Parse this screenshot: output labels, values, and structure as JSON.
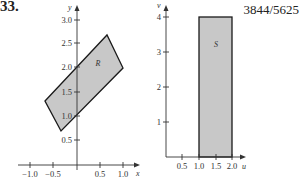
{
  "problem": {
    "number": "33.",
    "answer": "3844/5625"
  },
  "left_plot": {
    "x_axis_label": "x",
    "y_axis_label": "y",
    "x_ticks": [
      "−1.0",
      "−0.5",
      "0.5",
      "1.0"
    ],
    "y_ticks": [
      "0.5",
      "1.0",
      "1.5",
      "2.0",
      "2.5",
      "3.0"
    ],
    "region_label": "R",
    "region_vertices": [
      [
        -0.7,
        1.35
      ],
      [
        0.65,
        2.65
      ],
      [
        1.0,
        2.0
      ],
      [
        -0.35,
        0.7
      ]
    ],
    "fill_color": "#c8c8c8",
    "edge_color": "#1a1a1a"
  },
  "right_plot": {
    "x_axis_label": "u",
    "y_axis_label": "v",
    "x_ticks": [
      "0.5",
      "1.0",
      "1.5",
      "2.0"
    ],
    "y_ticks": [
      "1",
      "2",
      "3",
      "4"
    ],
    "region_label": "S",
    "region_vertices": [
      [
        1.0,
        0
      ],
      [
        2.0,
        0
      ],
      [
        2.0,
        4
      ],
      [
        1.0,
        4
      ]
    ],
    "fill_color": "#c8c8c8",
    "edge_color": "#1a1a1a"
  }
}
